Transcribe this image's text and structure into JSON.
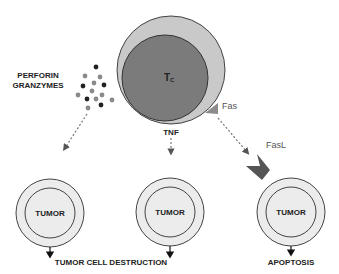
{
  "diagram": {
    "tc_cell": {
      "label_main": "T",
      "label_sub": "C",
      "outer_color": "#c9c9c9",
      "inner_color": "#7b7b7b"
    },
    "perforin_label_line1": "PERFORIN",
    "perforin_label_line2": "GRANZYMES",
    "tnf_label": "TNF",
    "fas_label": "Fas",
    "fasl_label": "FasL",
    "tumor_cells": [
      {
        "label": "TUMOR"
      },
      {
        "label": "TUMOR"
      },
      {
        "label": "TUMOR"
      }
    ],
    "outcome_destruction": "TUMOR CELL DESTRUCTION",
    "outcome_apoptosis": "APOPTOSIS",
    "colors": {
      "tumor_fill": "#ececec",
      "stroke": "#333333",
      "dot_dark": "#222222",
      "dot_gray": "#8a8a8a",
      "fas": "#8c8c8c",
      "fasl": "#555555"
    }
  }
}
